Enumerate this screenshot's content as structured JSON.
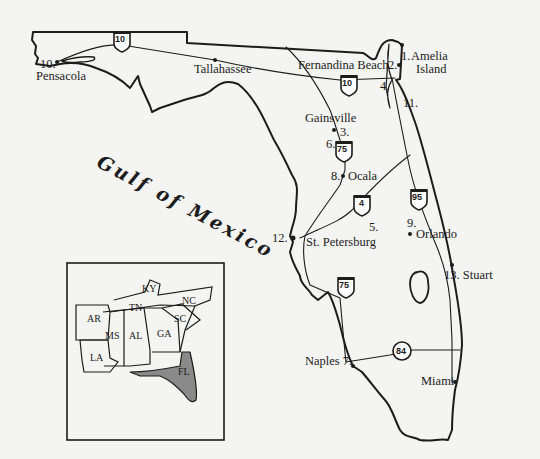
{
  "map": {
    "water_label": "Gulf of Mexico",
    "colors": {
      "background": "#f4f4f2",
      "ink": "#1c1c1c",
      "florida_inset_fill": "#8a8a8a"
    },
    "cities": {
      "pensacola": {
        "number": "10.",
        "name": "Pensacola"
      },
      "tallahassee": {
        "name": "Tallahassee"
      },
      "fernandina": {
        "name": "Fernandina Beach"
      },
      "amelia": {
        "number": "1.",
        "name_line1": "Amelia",
        "name_line2": "Island"
      },
      "two": {
        "number": "2."
      },
      "four": {
        "number": "4."
      },
      "eleven": {
        "number": "11."
      },
      "gainesville": {
        "name": "Gainsville",
        "number": "3."
      },
      "six": {
        "number": "6."
      },
      "ocala": {
        "number": "8.",
        "name": "Ocala"
      },
      "five": {
        "number": "5."
      },
      "orlando": {
        "number": "9.",
        "name": "Orlando"
      },
      "stpete": {
        "number": "12.",
        "name": "St. Petersburg"
      },
      "stuart": {
        "name": "13. Stuart"
      },
      "naples": {
        "name": "Naples 7."
      },
      "miami": {
        "name": "Miami"
      }
    },
    "highways": {
      "i10_west": "10",
      "i10_east": "10",
      "i75_north": "75",
      "i75_south": "75",
      "i4": "4",
      "i95": "95",
      "sr84": "84"
    },
    "inset": {
      "states": {
        "KY": "KY",
        "TN": "TN",
        "NC": "NC",
        "AR": "AR",
        "SC": "SC",
        "MS": "MS",
        "AL": "AL",
        "GA": "GA",
        "LA": "LA",
        "FL": "FL"
      },
      "highlighted": "FL"
    }
  }
}
